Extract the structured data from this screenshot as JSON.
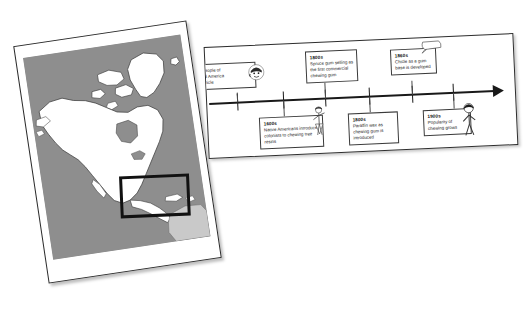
{
  "scene": {
    "description": "Two overlapping printed pages photographed on a white surface: a North America map page on the left and a chewing-gum history timeline page on the right",
    "background_color": "#ffffff"
  },
  "map_page": {
    "name": "North America map",
    "ocean_color": "#8e8e8e",
    "land_color": "#ffffff",
    "land_outline_color": "#3c3c3c",
    "secondary_land_color": "#c9c9c9",
    "paper_color": "#ffffff",
    "border_color": "#2a2a2a",
    "selection": {
      "label": "Central America and Mexico highlight",
      "stroke_color": "#111111"
    }
  },
  "timeline_page": {
    "paper_color": "#ffffff",
    "border_color": "#2d2d2d",
    "axis": {
      "color": "#191919",
      "direction": "left-to-right",
      "arrow": "right"
    },
    "events": [
      {
        "id": "event-chicle",
        "year": "",
        "year_fragment": "",
        "text": "e People of\nntral America\ne chicle",
        "full_text_visible": "…e People of / …ntral America / …e chicle",
        "position": "above",
        "clipped_by_page_edge": true,
        "figure": "ancient-person-icon"
      },
      {
        "id": "event-native-americans",
        "year": "1600s",
        "text": "Native Americans introduce colonists to chewing tree resins",
        "position": "below",
        "figure": "colonist-person-icon"
      },
      {
        "id": "event-spruce-gum",
        "year": "1800s",
        "text": "Spruce gum selling as the first commercial chewing gum",
        "position": "above",
        "figure": ""
      },
      {
        "id": "event-paraffin-wax",
        "year": "1800s",
        "text": "Paraffin wax as chewing gum is introduced",
        "position": "below",
        "figure": ""
      },
      {
        "id": "event-chicle-gum-base",
        "year": "1860s",
        "text": "Chicle as a gum base is developed",
        "position": "above",
        "figure": "speech-bubble-icon"
      },
      {
        "id": "event-popularity",
        "year": "1900s",
        "text": "Popularity of chewing grows",
        "position": "below",
        "figure": "modern-person-icon"
      }
    ]
  }
}
